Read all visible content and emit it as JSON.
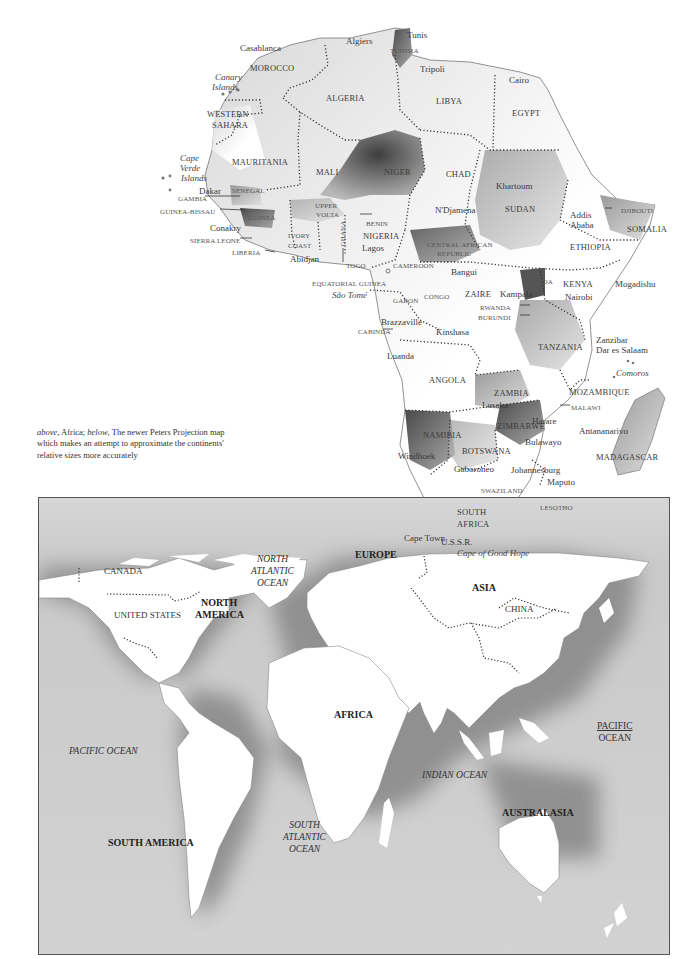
{
  "caption": {
    "italic_1": "above",
    "text_1": ", Africa; ",
    "italic_2": "below",
    "text_2": ", The newer Peters Projection map which makes an attempt to approximate the continents' relative sizes more accurately"
  },
  "africa": {
    "countries": [
      {
        "name": "MOROCCO",
        "x": 250,
        "y": 64
      },
      {
        "name": "ALGERIA",
        "x": 326,
        "y": 94
      },
      {
        "name": "TUNISIA",
        "x": 390,
        "y": 48
      },
      {
        "name": "LIBYA",
        "x": 436,
        "y": 97
      },
      {
        "name": "EGYPT",
        "x": 512,
        "y": 109
      },
      {
        "name": "WESTERN",
        "x": 207,
        "y": 110
      },
      {
        "name": "SAHARA",
        "x": 212,
        "y": 121
      },
      {
        "name": "MAURITANIA",
        "x": 232,
        "y": 158
      },
      {
        "name": "MALI",
        "x": 316,
        "y": 168
      },
      {
        "name": "NIGER",
        "x": 384,
        "y": 168
      },
      {
        "name": "CHAD",
        "x": 446,
        "y": 170
      },
      {
        "name": "SUDAN",
        "x": 505,
        "y": 205
      },
      {
        "name": "ETHIOPIA",
        "x": 570,
        "y": 243
      },
      {
        "name": "SOMALIA",
        "x": 627,
        "y": 225
      },
      {
        "name": "SENEGAL",
        "x": 232,
        "y": 188
      },
      {
        "name": "GUINEA",
        "x": 248,
        "y": 215
      },
      {
        "name": "UPPER",
        "x": 315,
        "y": 203
      },
      {
        "name": "VOLTA",
        "x": 316,
        "y": 212
      },
      {
        "name": "BENIN",
        "x": 366,
        "y": 221
      },
      {
        "name": "NIGERIA",
        "x": 363,
        "y": 232
      },
      {
        "name": "IVORY",
        "x": 288,
        "y": 233
      },
      {
        "name": "COAST",
        "x": 288,
        "y": 243
      },
      {
        "name": "CAMEROON",
        "x": 393,
        "y": 263
      },
      {
        "name": "CENTRAL AFRICAN",
        "x": 427,
        "y": 242
      },
      {
        "name": "REPUBLIC",
        "x": 437,
        "y": 251
      },
      {
        "name": "ZAIRE",
        "x": 465,
        "y": 290
      },
      {
        "name": "CONGO",
        "x": 424,
        "y": 294
      },
      {
        "name": "GABON",
        "x": 393,
        "y": 298
      },
      {
        "name": "UGANDA",
        "x": 522,
        "y": 279
      },
      {
        "name": "KENYA",
        "x": 563,
        "y": 280
      },
      {
        "name": "TANZANIA",
        "x": 538,
        "y": 343
      },
      {
        "name": "ANGOLA",
        "x": 429,
        "y": 376
      },
      {
        "name": "ZAMBIA",
        "x": 494,
        "y": 389
      },
      {
        "name": "MOZAMBIQUE",
        "x": 569,
        "y": 388
      },
      {
        "name": "ZIMBABWE",
        "x": 497,
        "y": 422
      },
      {
        "name": "NAMIBIA",
        "x": 423,
        "y": 431
      },
      {
        "name": "BOTSWANA",
        "x": 462,
        "y": 447
      },
      {
        "name": "MADAGASCAR",
        "x": 596,
        "y": 453
      },
      {
        "name": "SOUTH",
        "x": 457,
        "y": 508
      },
      {
        "name": "AFRICA",
        "x": 457,
        "y": 520
      }
    ],
    "small_labels": [
      {
        "name": "GAMBIA",
        "x": 178,
        "y": 196
      },
      {
        "name": "GUINEA-BISSAU",
        "x": 160,
        "y": 209
      },
      {
        "name": "SIERRA LEONE",
        "x": 190,
        "y": 238
      },
      {
        "name": "LIBERIA",
        "x": 232,
        "y": 250
      },
      {
        "name": "GHANA",
        "x": 337,
        "y": 224
      },
      {
        "name": "TOGO",
        "x": 346,
        "y": 263
      },
      {
        "name": "EQUATORIAL GUINEA",
        "x": 312,
        "y": 281
      },
      {
        "name": "CABINDA",
        "x": 358,
        "y": 329
      },
      {
        "name": "RWANDA",
        "x": 480,
        "y": 305
      },
      {
        "name": "BURUNDI",
        "x": 478,
        "y": 315
      },
      {
        "name": "DJIBOUTI",
        "x": 621,
        "y": 208
      },
      {
        "name": "MALAWI",
        "x": 571,
        "y": 405
      },
      {
        "name": "SWAZILAND",
        "x": 481,
        "y": 488
      },
      {
        "name": "LESOTHO",
        "x": 540,
        "y": 505
      }
    ],
    "cities": [
      {
        "name": "Tunis",
        "x": 407,
        "y": 31
      },
      {
        "name": "Algiers",
        "x": 346,
        "y": 37
      },
      {
        "name": "Casablanca",
        "x": 240,
        "y": 48
      },
      {
        "name": "Tripoli",
        "x": 420,
        "y": 65
      },
      {
        "name": "Cairo",
        "x": 509,
        "y": 76
      },
      {
        "name": "Khartoum",
        "x": 496,
        "y": 182
      },
      {
        "name": "Addis",
        "x": 570,
        "y": 211
      },
      {
        "name": "Ababa",
        "x": 570,
        "y": 221
      },
      {
        "name": "Dakar",
        "x": 199,
        "y": 187
      },
      {
        "name": "Conakry",
        "x": 210,
        "y": 224
      },
      {
        "name": "Abidjan",
        "x": 290,
        "y": 255
      },
      {
        "name": "Lagos",
        "x": 362,
        "y": 244
      },
      {
        "name": "N'Djamena",
        "x": 435,
        "y": 206
      },
      {
        "name": "Bangui",
        "x": 451,
        "y": 268
      },
      {
        "name": "Kampala",
        "x": 500,
        "y": 290
      },
      {
        "name": "Nairobi",
        "x": 565,
        "y": 293
      },
      {
        "name": "Mogadishu",
        "x": 615,
        "y": 280
      },
      {
        "name": "Brazzaville",
        "x": 381,
        "y": 318
      },
      {
        "name": "Kinshasa",
        "x": 436,
        "y": 328
      },
      {
        "name": "Zanzibar",
        "x": 596,
        "y": 336
      },
      {
        "name": "Dar es Salaam",
        "x": 596,
        "y": 346
      },
      {
        "name": "Luanda",
        "x": 387,
        "y": 352
      },
      {
        "name": "Lusaka",
        "x": 482,
        "y": 401
      },
      {
        "name": "Harare",
        "x": 532,
        "y": 417
      },
      {
        "name": "Bulawayo",
        "x": 525,
        "y": 438
      },
      {
        "name": "Antananarivo",
        "x": 579,
        "y": 427
      },
      {
        "name": "Windhoek",
        "x": 398,
        "y": 452
      },
      {
        "name": "Gaboroneo",
        "x": 454,
        "y": 465
      },
      {
        "name": "Johannesburg",
        "x": 511,
        "y": 466
      },
      {
        "name": "Maputo",
        "x": 547,
        "y": 478
      },
      {
        "name": "Cape Town",
        "x": 404,
        "y": 534
      }
    ],
    "italic_labels": [
      {
        "name": "Canary",
        "x": 215,
        "y": 73
      },
      {
        "name": "Islands",
        "x": 212,
        "y": 83
      },
      {
        "name": "Cape",
        "x": 180,
        "y": 154
      },
      {
        "name": "Verde",
        "x": 180,
        "y": 164
      },
      {
        "name": "Islands",
        "x": 181,
        "y": 174
      },
      {
        "name": "São Tomé",
        "x": 332,
        "y": 291
      },
      {
        "name": "Comoros",
        "x": 616,
        "y": 369
      },
      {
        "name": "Cape of Good Hope",
        "x": 457,
        "y": 549
      }
    ]
  },
  "world": {
    "continents": [
      {
        "name": "NORTH",
        "x": 162,
        "y": 99
      },
      {
        "name": "AMERICA",
        "x": 156,
        "y": 111
      },
      {
        "name": "EUROPE",
        "x": 316,
        "y": 51
      },
      {
        "name": "ASIA",
        "x": 433,
        "y": 84
      },
      {
        "name": "AFRICA",
        "x": 295,
        "y": 211
      },
      {
        "name": "SOUTH AMERICA",
        "x": 69,
        "y": 339
      },
      {
        "name": "AUSTRALASIA",
        "x": 463,
        "y": 309
      }
    ],
    "countries": [
      {
        "name": "CANADA",
        "x": 65,
        "y": 68
      },
      {
        "name": "UNITED STATES",
        "x": 75,
        "y": 112
      },
      {
        "name": "U.S.S.R.",
        "x": 402,
        "y": 39
      },
      {
        "name": "CHINA",
        "x": 466,
        "y": 106
      }
    ],
    "oceans": [
      {
        "lines": [
          "NORTH",
          "ATLANTIC",
          "OCEAN"
        ],
        "x": 212,
        "y": 56,
        "style": "italic"
      },
      {
        "lines": [
          "PACIFIC OCEAN"
        ],
        "x": 30,
        "y": 248,
        "style": "italic"
      },
      {
        "lines": [
          "SOUTH",
          "ATLANTIC",
          "OCEAN"
        ],
        "x": 244,
        "y": 322,
        "style": "italic"
      },
      {
        "lines": [
          "INDIAN OCEAN"
        ],
        "x": 383,
        "y": 272,
        "style": "italic"
      },
      {
        "lines": [
          "PACIFIC",
          "OCEAN"
        ],
        "x": 558,
        "y": 223,
        "style": "underline"
      }
    ]
  },
  "colors": {
    "land_light": "#ffffff",
    "land_mid": "#bdbdbd",
    "land_dark": "#5a5a5a",
    "ocean": "#c6c6c6",
    "border_dots": "#333333",
    "coast": "#666666"
  }
}
